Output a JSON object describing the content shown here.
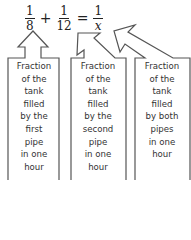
{
  "equation": {
    "terms": [
      {
        "numerator": "1",
        "denominator": "8"
      },
      {
        "numerator": "1",
        "denominator": "12"
      },
      {
        "numerator": "1",
        "denominator": "x"
      }
    ],
    "operators": [
      "+",
      "="
    ]
  },
  "boxes": [
    {
      "lines": [
        "Fraction",
        "of the",
        "tank",
        "filled",
        "by the",
        "first",
        "pipe",
        "in one",
        "hour"
      ]
    },
    {
      "lines": [
        "Fraction",
        "of the",
        "tank",
        "filled",
        "by the",
        "second",
        "pipe",
        "in one",
        "hour"
      ]
    },
    {
      "lines": [
        "Fraction",
        "of the",
        "tank",
        "filled",
        "by both",
        "pipes",
        "in one",
        "hour"
      ]
    }
  ],
  "colors": {
    "stroke": "#555555",
    "text": "#333333"
  }
}
